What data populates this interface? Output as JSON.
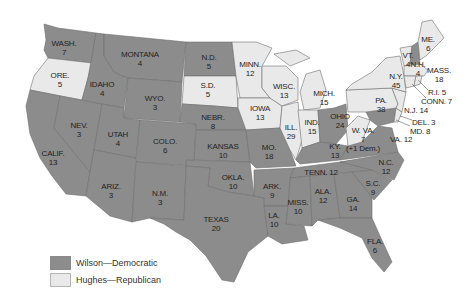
{
  "colors": {
    "democratic": "#8c8c8c",
    "republican": "#e9e9e9",
    "border": "#6e6e6e",
    "text": "#1f1f1f"
  },
  "legend": [
    {
      "label": "Wilson—Democratic",
      "party": "democratic"
    },
    {
      "label": "Hughes—Republican",
      "party": "republican"
    }
  ],
  "states": {
    "wash": {
      "abbr": "WASH.",
      "votes": "7",
      "party": "democratic"
    },
    "ore": {
      "abbr": "ORE.",
      "votes": "5",
      "party": "republican"
    },
    "calif": {
      "abbr": "CALIF.",
      "votes": "13",
      "party": "democratic"
    },
    "idaho": {
      "abbr": "IDAHO",
      "votes": "4",
      "party": "democratic"
    },
    "nev": {
      "abbr": "NEV.",
      "votes": "3",
      "party": "democratic"
    },
    "montana": {
      "abbr": "MONTANA",
      "votes": "4",
      "party": "democratic"
    },
    "wyo": {
      "abbr": "WYO.",
      "votes": "3",
      "party": "democratic"
    },
    "utah": {
      "abbr": "UTAH",
      "votes": "4",
      "party": "democratic"
    },
    "ariz": {
      "abbr": "ARIZ.",
      "votes": "3",
      "party": "democratic"
    },
    "colo": {
      "abbr": "COLO.",
      "votes": "6",
      "party": "democratic"
    },
    "nm": {
      "abbr": "N.M.",
      "votes": "3",
      "party": "democratic"
    },
    "nd": {
      "abbr": "N.D.",
      "votes": "5",
      "party": "democratic"
    },
    "sd": {
      "abbr": "S.D.",
      "votes": "5",
      "party": "republican"
    },
    "nebr": {
      "abbr": "NEBR.",
      "votes": "8",
      "party": "democratic"
    },
    "kansas": {
      "abbr": "KANSAS",
      "votes": "10",
      "party": "democratic"
    },
    "okla": {
      "abbr": "OKLA.",
      "votes": "10",
      "party": "democratic"
    },
    "texas": {
      "abbr": "TEXAS",
      "votes": "20",
      "party": "democratic"
    },
    "minn": {
      "abbr": "MINN.",
      "votes": "12",
      "party": "republican"
    },
    "iowa": {
      "abbr": "IOWA",
      "votes": "13",
      "party": "republican"
    },
    "mo": {
      "abbr": "MO.",
      "votes": "18",
      "party": "democratic"
    },
    "ark": {
      "abbr": "ARK.",
      "votes": "9",
      "party": "democratic"
    },
    "la": {
      "abbr": "LA.",
      "votes": "10",
      "party": "democratic"
    },
    "wisc": {
      "abbr": "WISC.",
      "votes": "13",
      "party": "republican"
    },
    "ill": {
      "abbr": "ILL.",
      "votes": "29",
      "party": "republican"
    },
    "mich": {
      "abbr": "MICH.",
      "votes": "15",
      "party": "republican"
    },
    "ind": {
      "abbr": "IND.",
      "votes": "15",
      "party": "republican"
    },
    "ohio": {
      "abbr": "OHIO",
      "votes": "24",
      "party": "democratic"
    },
    "ky": {
      "abbr": "KY.",
      "votes": "13",
      "party": "democratic"
    },
    "tenn": {
      "abbr": "TENN.",
      "votes": "12",
      "party": "democratic"
    },
    "miss": {
      "abbr": "MISS.",
      "votes": "10",
      "party": "democratic"
    },
    "ala": {
      "abbr": "ALA.",
      "votes": "12",
      "party": "democratic"
    },
    "ga": {
      "abbr": "GA.",
      "votes": "14",
      "party": "democratic"
    },
    "fla": {
      "abbr": "FLA.",
      "votes": "6",
      "party": "democratic"
    },
    "sc": {
      "abbr": "S.C.",
      "votes": "9",
      "party": "democratic"
    },
    "nc": {
      "abbr": "N.C.",
      "votes": "12",
      "party": "democratic"
    },
    "va": {
      "abbr": "VA.",
      "votes": "12",
      "party": "democratic"
    },
    "wva": {
      "abbr": "W. VA.",
      "votes": "7",
      "note": "(+1 Dem.)",
      "party": "republican"
    },
    "pa": {
      "abbr": "PA.",
      "votes": "38",
      "party": "republican"
    },
    "ny": {
      "abbr": "N.Y.",
      "votes": "45",
      "party": "republican"
    },
    "vt": {
      "abbr": "VT.",
      "votes": "4",
      "party": "republican"
    },
    "nh": {
      "abbr": "N.H.",
      "votes": "4",
      "party": "democratic"
    },
    "me": {
      "abbr": "ME.",
      "votes": "6",
      "party": "republican"
    },
    "mass": {
      "abbr": "MASS.",
      "votes": "18",
      "party": "republican"
    },
    "ri": {
      "label": "R.I. 5",
      "party": "republican"
    },
    "conn": {
      "label": "CONN. 7",
      "party": "republican"
    },
    "nj": {
      "label": "N.J. 14",
      "party": "republican"
    },
    "del": {
      "label": "DEL. 3",
      "party": "republican"
    },
    "md": {
      "label": "MD. 8",
      "party": "democratic"
    }
  }
}
